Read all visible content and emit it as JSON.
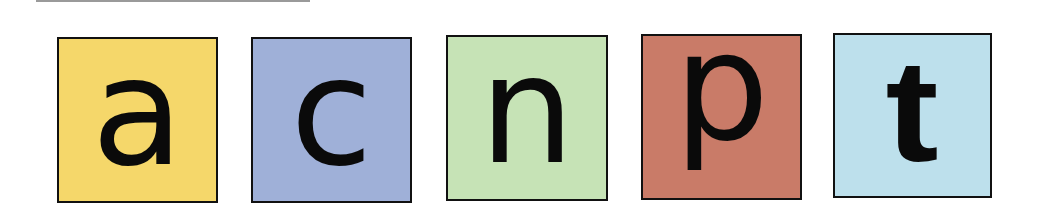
{
  "tiles": [
    {
      "letter": "a",
      "color": "#f5d76a"
    },
    {
      "letter": "c",
      "color": "#9fb0d8"
    },
    {
      "letter": "n",
      "color": "#c6e3b6"
    },
    {
      "letter": "p",
      "color": "#c97b68"
    },
    {
      "letter": "t",
      "color": "#bde0ec"
    }
  ]
}
